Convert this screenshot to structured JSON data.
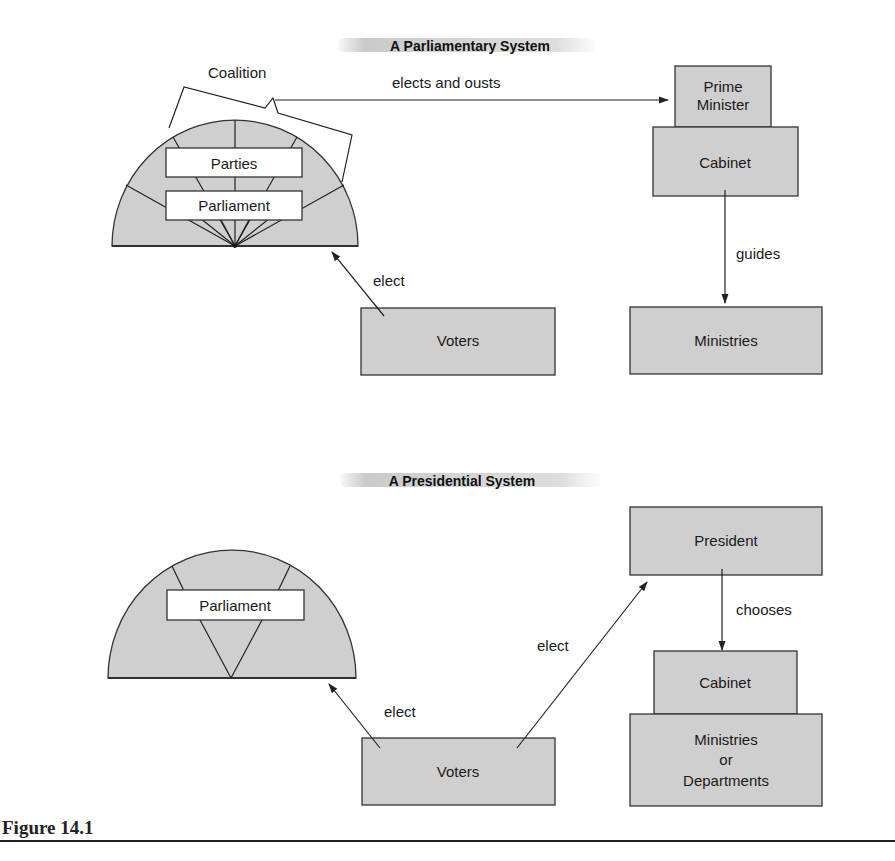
{
  "parliamentary": {
    "title": "A Parliamentary System",
    "coalition_label": "Coalition",
    "elects_ousts_label": "elects and ousts",
    "parties_label": "Parties",
    "parliament_label": "Parliament",
    "prime_minister_line1": "Prime",
    "prime_minister_line2": "Minister",
    "cabinet_label": "Cabinet",
    "guides_label": "guides",
    "ministries_label": "Ministries",
    "voters_label": "Voters",
    "elect_label": "elect"
  },
  "presidential": {
    "title": "A Presidential System",
    "parliament_label": "Parliament",
    "president_label": "President",
    "chooses_label": "chooses",
    "cabinet_label": "Cabinet",
    "ministries_line1": "Ministries",
    "ministries_line2": "or",
    "ministries_line3": "Departments",
    "voters_label": "Voters",
    "elect_parliament_label": "elect",
    "elect_president_label": "elect"
  },
  "figure": {
    "caption": "Figure 14.1"
  },
  "colors": {
    "box_fill": "#cfcfcf",
    "stroke": "#333333"
  }
}
